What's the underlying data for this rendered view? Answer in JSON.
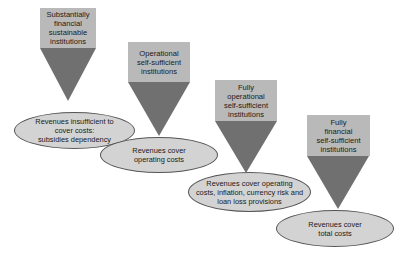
{
  "stages": [
    {
      "institution": "Substantially\nfinancial\nsustainable\ninstitutions",
      "revenue": "Revenues insufficient to\ncover costs:\nsubsidies dependency"
    },
    {
      "institution": "Operational\nself-sufficient\ninstitutions",
      "revenue": "Revenues cover\noperating costs"
    },
    {
      "institution": "Fully\noperational\nself-sufficient\ninstitutions",
      "revenue": "Revenues cover operating\ncosts, inflation, currency risk and\nloan loss provisions"
    },
    {
      "institution": "Fully\nfinancial\nself-sufficient\ninstitutions",
      "revenue": "Revenues cover\ntotal costs"
    }
  ],
  "colors": {
    "box_fill": "#b9b9b9",
    "arrow_fill": "#707070",
    "ellipse_fill": "#d3d3d3",
    "ellipse_border": "#555555"
  }
}
